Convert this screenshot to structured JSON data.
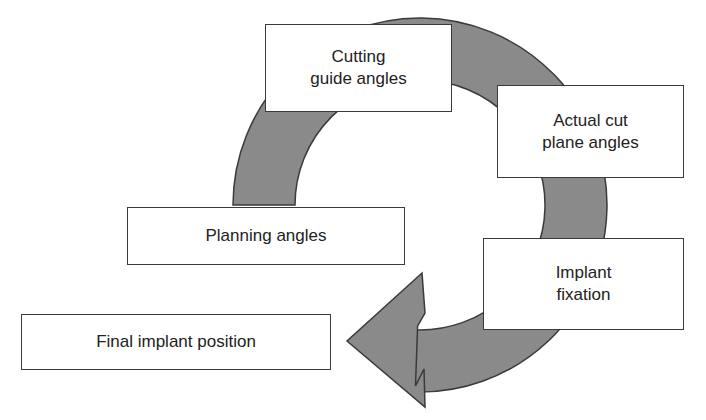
{
  "diagram": {
    "type": "cycle-flow",
    "arrow_color": "#8a8a8a",
    "outline_color": "#3a3a3a",
    "nodes": [
      {
        "id": "planning",
        "label": "Planning angles"
      },
      {
        "id": "cutting",
        "label": "Cutting\nguide angles"
      },
      {
        "id": "actual",
        "label": "Actual cut\nplane angles"
      },
      {
        "id": "implant",
        "label": "Implant\nfixation"
      },
      {
        "id": "final",
        "label": "Final implant position"
      }
    ],
    "flow": [
      "planning",
      "cutting",
      "actual",
      "implant",
      "final"
    ]
  }
}
